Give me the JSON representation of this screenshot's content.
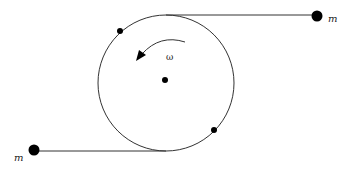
{
  "diagram": {
    "left_mass_label": "m",
    "right_mass_label": "m",
    "angular_velocity_label": "ω",
    "line_color": "#333333",
    "mass_color": "#000000"
  }
}
